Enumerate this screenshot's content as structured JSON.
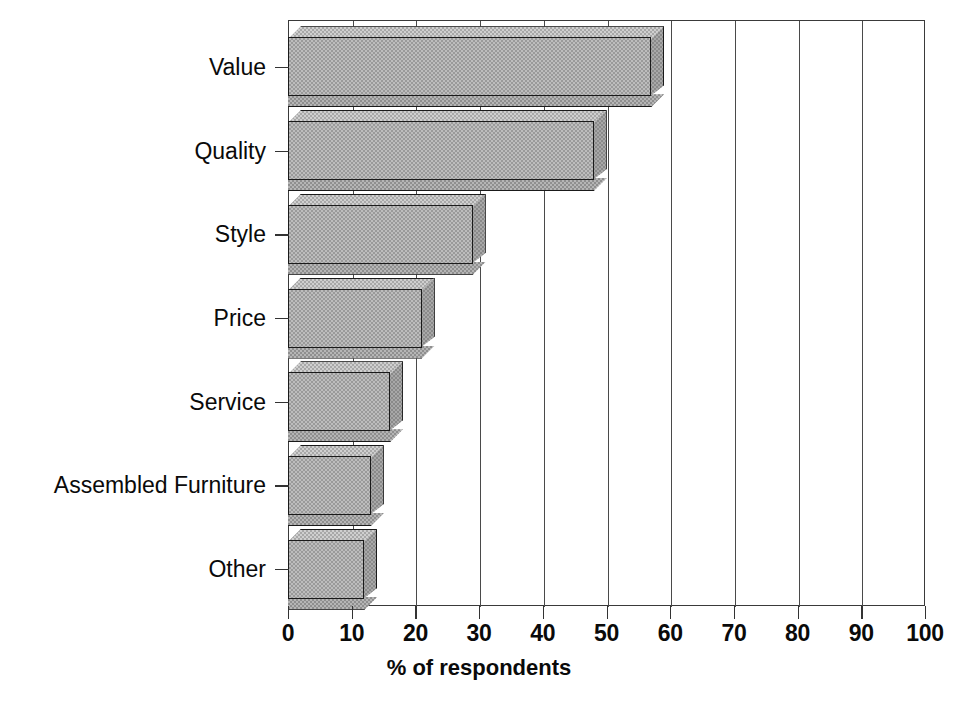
{
  "chart_data": {
    "type": "bar",
    "orientation": "horizontal",
    "title": "",
    "subtitle": "",
    "xlabel": "% of respondents",
    "ylabel": "",
    "xlim": [
      0,
      100
    ],
    "xticks": [
      "0",
      "10",
      "20",
      "30",
      "40",
      "50",
      "60",
      "70",
      "80",
      "90",
      "100"
    ],
    "xtick_values": [
      0,
      10,
      20,
      30,
      40,
      50,
      60,
      70,
      80,
      90,
      100
    ],
    "grid": "vertical",
    "legend": "none",
    "style": "3d-shaded-bars",
    "categories": [
      "Value",
      "Quality",
      "Style",
      "Price",
      "Service",
      "Assembled Furniture",
      "Other"
    ],
    "values": [
      58,
      49,
      31,
      22,
      18,
      15,
      14
    ],
    "front_face_values": [
      57,
      48,
      29,
      21,
      16,
      13,
      12
    ],
    "series": [
      {
        "name": "% of respondents",
        "values": [
          58,
          49,
          31,
          22,
          18,
          15,
          14
        ]
      }
    ],
    "colors": {
      "bar_fill": "#bdbdbd",
      "bar_top": "#cfcfcf",
      "bar_side": "#a8a8a8",
      "outline": "#1a1a1a",
      "grid": "#4a4a4a",
      "axis": "#333333",
      "background": "#ffffff",
      "text": "#0a0a0a"
    }
  },
  "axis": {
    "x_title": "% of respondents"
  }
}
